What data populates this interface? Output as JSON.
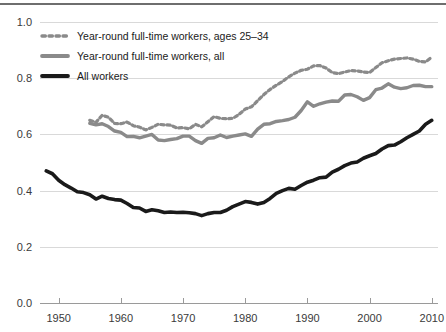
{
  "chart_data": {
    "type": "line",
    "title": "",
    "xlabel": "",
    "ylabel": "",
    "xlim": [
      1947,
      2011
    ],
    "ylim": [
      0.0,
      1.0
    ],
    "grid": true,
    "legend_position": "top-left",
    "x_ticks": [
      "1950",
      "1960",
      "1970",
      "1980",
      "1990",
      "2000",
      "2010"
    ],
    "x_tick_values": [
      1950,
      1960,
      1970,
      1980,
      1990,
      2000,
      2010
    ],
    "y_ticks": [
      "0.0",
      "0.2",
      "0.4",
      "0.6",
      "0.8",
      "1.0"
    ],
    "y_tick_values": [
      0.0,
      0.2,
      0.4,
      0.6,
      0.8,
      1.0
    ],
    "series": [
      {
        "name": "Year-round full-time workers, ages 25-34",
        "legend_label": "Year-round full-time workers, ages 25–34",
        "style": "dotted",
        "color": "#8a8a8a",
        "width": 3.2,
        "x": [
          1955,
          1956,
          1957,
          1958,
          1959,
          1960,
          1961,
          1962,
          1963,
          1964,
          1965,
          1966,
          1967,
          1968,
          1969,
          1970,
          1971,
          1972,
          1973,
          1974,
          1975,
          1976,
          1977,
          1978,
          1979,
          1980,
          1981,
          1982,
          1983,
          1984,
          1985,
          1986,
          1987,
          1988,
          1989,
          1990,
          1991,
          1992,
          1993,
          1994,
          1995,
          1996,
          1997,
          1998,
          1999,
          2000,
          2001,
          2002,
          2003,
          2004,
          2005,
          2006,
          2007,
          2008,
          2009,
          2010
        ],
        "y": [
          0.65,
          0.643,
          0.668,
          0.661,
          0.639,
          0.638,
          0.644,
          0.631,
          0.626,
          0.616,
          0.625,
          0.636,
          0.634,
          0.633,
          0.623,
          0.624,
          0.62,
          0.636,
          0.627,
          0.645,
          0.663,
          0.657,
          0.656,
          0.657,
          0.671,
          0.69,
          0.698,
          0.72,
          0.742,
          0.76,
          0.775,
          0.788,
          0.805,
          0.818,
          0.828,
          0.832,
          0.844,
          0.845,
          0.836,
          0.82,
          0.816,
          0.822,
          0.827,
          0.826,
          0.822,
          0.82,
          0.838,
          0.855,
          0.862,
          0.868,
          0.87,
          0.872,
          0.868,
          0.86,
          0.858,
          0.875
        ]
      },
      {
        "name": "Year-round full-time workers, all",
        "legend_label": "Year-round full-time workers, all",
        "style": "solid",
        "color": "#8a8a8a",
        "width": 3.4,
        "x": [
          1955,
          1956,
          1957,
          1958,
          1959,
          1960,
          1961,
          1962,
          1963,
          1964,
          1965,
          1966,
          1967,
          1968,
          1969,
          1970,
          1971,
          1972,
          1973,
          1974,
          1975,
          1976,
          1977,
          1978,
          1979,
          1980,
          1981,
          1982,
          1983,
          1984,
          1985,
          1986,
          1987,
          1988,
          1989,
          1990,
          1991,
          1992,
          1993,
          1994,
          1995,
          1996,
          1997,
          1998,
          1999,
          2000,
          2001,
          2002,
          2003,
          2004,
          2005,
          2006,
          2007,
          2008,
          2009,
          2010
        ],
        "y": [
          0.639,
          0.634,
          0.638,
          0.628,
          0.612,
          0.607,
          0.592,
          0.593,
          0.588,
          0.594,
          0.6,
          0.58,
          0.578,
          0.582,
          0.585,
          0.594,
          0.594,
          0.578,
          0.568,
          0.586,
          0.588,
          0.598,
          0.589,
          0.594,
          0.598,
          0.602,
          0.593,
          0.619,
          0.636,
          0.638,
          0.646,
          0.649,
          0.653,
          0.661,
          0.685,
          0.716,
          0.7,
          0.709,
          0.715,
          0.719,
          0.718,
          0.74,
          0.742,
          0.734,
          0.721,
          0.731,
          0.759,
          0.765,
          0.78,
          0.768,
          0.763,
          0.766,
          0.774,
          0.775,
          0.77,
          0.77
        ]
      },
      {
        "name": "All workers",
        "legend_label": "All workers",
        "style": "solid",
        "color": "#1a1a1a",
        "width": 3.6,
        "x": [
          1948,
          1949,
          1950,
          1951,
          1952,
          1953,
          1954,
          1955,
          1956,
          1957,
          1958,
          1959,
          1960,
          1961,
          1962,
          1963,
          1964,
          1965,
          1966,
          1967,
          1968,
          1969,
          1970,
          1971,
          1972,
          1973,
          1974,
          1975,
          1976,
          1977,
          1978,
          1979,
          1980,
          1981,
          1982,
          1983,
          1984,
          1985,
          1986,
          1987,
          1988,
          1989,
          1990,
          1991,
          1992,
          1993,
          1994,
          1995,
          1996,
          1997,
          1998,
          1999,
          2000,
          2001,
          2002,
          2003,
          2004,
          2005,
          2006,
          2007,
          2008,
          2009,
          2010
        ],
        "y": [
          0.47,
          0.46,
          0.437,
          0.421,
          0.409,
          0.396,
          0.393,
          0.385,
          0.37,
          0.38,
          0.372,
          0.368,
          0.366,
          0.354,
          0.34,
          0.338,
          0.326,
          0.332,
          0.328,
          0.322,
          0.324,
          0.322,
          0.323,
          0.321,
          0.318,
          0.311,
          0.318,
          0.322,
          0.322,
          0.33,
          0.343,
          0.352,
          0.361,
          0.358,
          0.352,
          0.358,
          0.372,
          0.39,
          0.4,
          0.408,
          0.405,
          0.418,
          0.43,
          0.437,
          0.446,
          0.448,
          0.466,
          0.476,
          0.489,
          0.498,
          0.502,
          0.515,
          0.524,
          0.532,
          0.548,
          0.56,
          0.562,
          0.574,
          0.588,
          0.6,
          0.612,
          0.636,
          0.65
        ]
      }
    ]
  },
  "legend": {
    "items": [
      {
        "label": "Year-round full-time workers, ages 25–34",
        "style": "dotted",
        "color": "#8a8a8a"
      },
      {
        "label": "Year-round full-time workers, all",
        "style": "solid",
        "color": "#8a8a8a"
      },
      {
        "label": "All workers",
        "style": "solid",
        "color": "#1a1a1a"
      }
    ]
  }
}
